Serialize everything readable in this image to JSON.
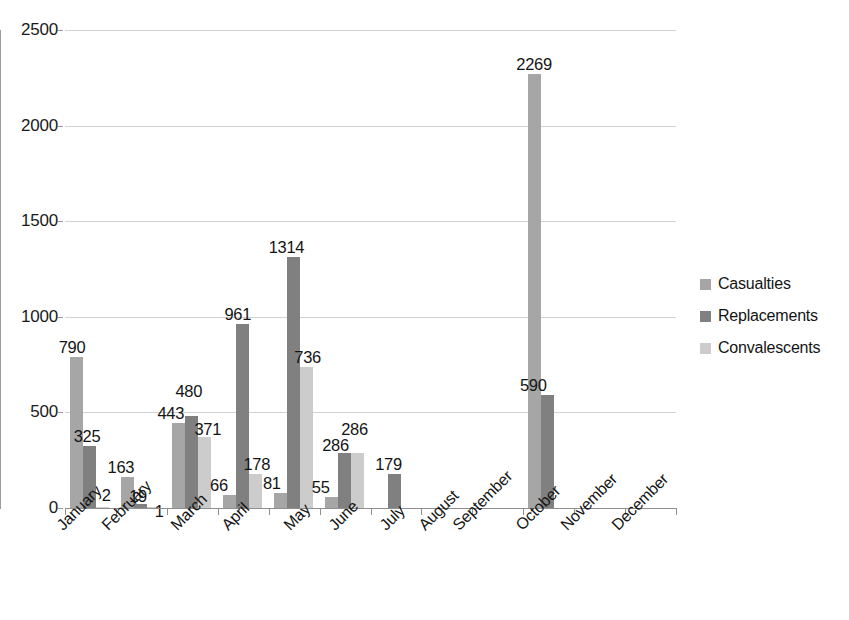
{
  "chart_data": {
    "type": "bar",
    "title": "",
    "subtitle": "",
    "xlabel": "",
    "ylabel": "",
    "ylim": [
      0,
      2500
    ],
    "ytick_values": [
      0,
      500,
      1000,
      1500,
      2000,
      2500
    ],
    "ytick_labels": [
      "0",
      "500",
      "1000",
      "1500",
      "2000",
      "2500"
    ],
    "grid": true,
    "legend_position": "right",
    "categories": [
      "January",
      "February",
      "March",
      "April",
      "May",
      "June",
      "July",
      "August",
      "September",
      "October",
      "November",
      "December"
    ],
    "series": [
      {
        "name": "Casualties",
        "color": "#a6a6a6",
        "values": [
          790,
          163,
          443,
          66,
          81,
          55,
          0,
          0,
          0,
          2269,
          0,
          0
        ],
        "labels": [
          "790",
          "163",
          "443",
          "66",
          "81",
          "55",
          "",
          "",
          "",
          "2269",
          "",
          ""
        ]
      },
      {
        "name": "Replacements",
        "color": "#808080",
        "values": [
          325,
          19,
          480,
          961,
          1314,
          286,
          179,
          0,
          0,
          590,
          0,
          0
        ],
        "labels": [
          "325",
          "19",
          "480",
          "961",
          "1314",
          "286",
          "179",
          "",
          "",
          "590",
          "",
          ""
        ]
      },
      {
        "name": "Convalescents",
        "color": "#cccccc",
        "values": [
          2,
          1,
          371,
          178,
          736,
          286,
          0,
          0,
          0,
          0,
          0,
          0
        ],
        "labels": [
          "2",
          "1",
          "371",
          "178",
          "736",
          "286",
          "",
          "",
          "",
          "",
          "",
          ""
        ]
      }
    ]
  },
  "legend": {
    "items": [
      {
        "label": "Casualties",
        "color": "#a6a6a6"
      },
      {
        "label": "Replacements",
        "color": "#808080"
      },
      {
        "label": "Convalescents",
        "color": "#cccccc"
      }
    ]
  },
  "axis": {
    "y_labels": [
      "2500",
      "2000",
      "1500",
      "1000",
      "500",
      "0"
    ],
    "x_labels": [
      "January",
      "February",
      "March",
      "April",
      "May",
      "June",
      "July",
      "August",
      "September",
      "October",
      "November",
      "December"
    ]
  }
}
